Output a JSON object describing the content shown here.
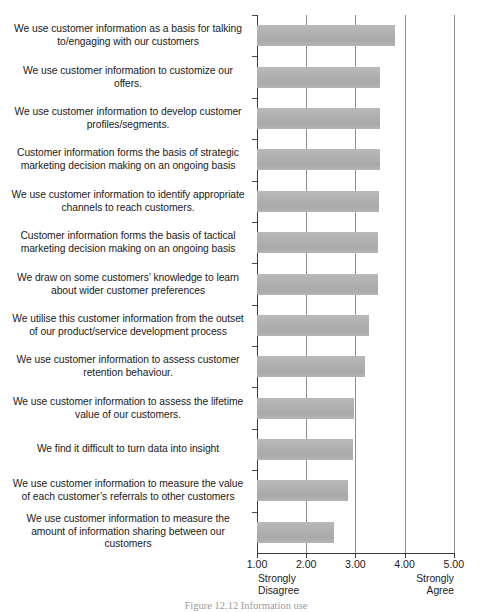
{
  "figure": {
    "caption": "Figure 12.12  Information use"
  },
  "axis": {
    "ticks": [
      "1.00",
      "2.00",
      "3.00",
      "4.00",
      "5.00"
    ],
    "tick_values": [
      1,
      2,
      3,
      4,
      5
    ],
    "low_anchor_line1": "Strongly",
    "low_anchor_line2": "Disagree",
    "high_anchor_line1": "Strongly",
    "high_anchor_line2": "Agree"
  },
  "style": {
    "bar_color": "#b2b2b2",
    "gridline_color": "#8d8d8d",
    "axis_color": "#3a3a3a",
    "text_color": "#1a1a1a"
  },
  "chart_data": {
    "type": "bar",
    "orientation": "horizontal",
    "title": "",
    "xlabel": "",
    "ylabel": "",
    "xlim": [
      1,
      5
    ],
    "grid": true,
    "legend": false,
    "xticks": [
      1,
      2,
      3,
      4,
      5
    ],
    "xticklabels": [
      "1.00",
      "2.00",
      "3.00",
      "4.00",
      "5.00"
    ],
    "x_low_anchor": "Strongly Disagree",
    "x_high_anchor": "Strongly Agree",
    "categories": [
      "We use customer information as a basis for talking to/engaging with our customers",
      "We use customer information to customize our offers.",
      "We use customer information to develop customer profiles/segments.",
      "Customer information forms the basis of strategic marketing decision making on an ongoing basis",
      "We use customer information to identify appropriate channels to reach customers.",
      "Customer information forms the basis of tactical marketing decision making on an ongoing basis",
      "We draw on some customers’ knowledge to learn about wider customer preferences",
      "We utilise this customer information from the outset of our product/service development process",
      "We use customer information to assess customer retention behaviour.",
      "We use customer information to assess the lifetime value of our customers.",
      "We find it difficult to turn data into insight",
      "We use customer information to measure the value of each customer’s referrals to other customers",
      "We use customer information to measure the amount of information sharing between our customers"
    ],
    "values": [
      3.8,
      3.5,
      3.5,
      3.5,
      3.48,
      3.45,
      3.45,
      3.27,
      3.2,
      2.98,
      2.95,
      2.84,
      2.57
    ]
  }
}
